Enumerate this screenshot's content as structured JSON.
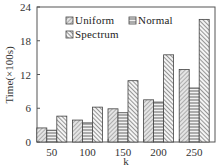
{
  "chart_data": {
    "type": "bar",
    "title": "",
    "xlabel": "k",
    "ylabel": "Time(×100s)",
    "categories": [
      "50",
      "100",
      "150",
      "200",
      "250"
    ],
    "series": [
      {
        "name": "Uniform",
        "pattern": "diag-fine",
        "values": [
          2.5,
          3.9,
          5.9,
          7.5,
          12.9
        ]
      },
      {
        "name": "Normal",
        "pattern": "horizontal",
        "values": [
          2.1,
          3.4,
          5.2,
          7.1,
          9.6
        ]
      },
      {
        "name": "Spectrum",
        "pattern": "diag-coarse",
        "values": [
          4.6,
          6.2,
          10.9,
          15.5,
          21.8
        ]
      }
    ],
    "ylim": [
      0,
      24
    ],
    "yticks": [
      0,
      6,
      12,
      18,
      24
    ],
    "grid": false,
    "legend_position": "upper-left-inside"
  },
  "legend": {
    "items": [
      "Uniform",
      "Normal",
      "Spectrum"
    ]
  },
  "axes": {
    "x_title": "k",
    "y_title": "Time(×100s)"
  },
  "colors": {
    "axis": "#555555",
    "bar_stroke": "#444444",
    "hatch": "#666666",
    "bar_fill": "#e6e6e6"
  }
}
